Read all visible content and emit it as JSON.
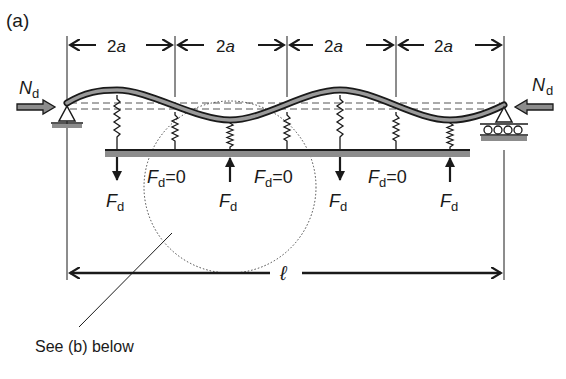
{
  "figure": {
    "panel_label": "(a)",
    "spans": [
      {
        "label_num": "2",
        "label_var": "a"
      },
      {
        "label_num": "2",
        "label_var": "a"
      },
      {
        "label_num": "2",
        "label_var": "a"
      },
      {
        "label_num": "2",
        "label_var": "a"
      }
    ],
    "axial_force_left": {
      "symbol": "N",
      "subscript": "d"
    },
    "axial_force_right": {
      "symbol": "N",
      "subscript": "d"
    },
    "forces": [
      {
        "symbol": "F",
        "subscript": "d",
        "value": "",
        "direction": "down"
      },
      {
        "symbol": "F",
        "subscript": "d",
        "value": "=0"
      },
      {
        "symbol": "F",
        "subscript": "d",
        "value": "",
        "direction": "up"
      },
      {
        "symbol": "F",
        "subscript": "d",
        "value": "=0"
      },
      {
        "symbol": "F",
        "subscript": "d",
        "value": "",
        "direction": "down"
      },
      {
        "symbol": "F",
        "subscript": "d",
        "value": "=0"
      },
      {
        "symbol": "F",
        "subscript": "d",
        "value": "",
        "direction": "up"
      }
    ],
    "length_label": "ℓ",
    "callout": "See (b) below",
    "colors": {
      "ink": "#1a1a1a",
      "beam_fill": "#9a9a9a",
      "ground_fill": "#8c8c8c"
    }
  }
}
